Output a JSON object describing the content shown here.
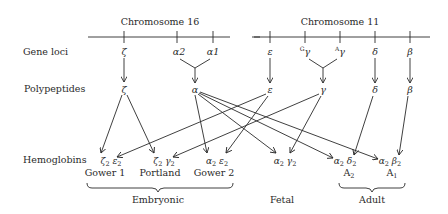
{
  "chromosomes": [
    {
      "label": "Chromosome 16",
      "genes": [
        "ζ",
        "α2",
        "α1"
      ]
    },
    {
      "label": "Chromosome 11",
      "genes": [
        "ε",
        "Gγ",
        "Aγ",
        "δ",
        "β"
      ]
    }
  ],
  "row_labels": {
    "gene_loci": "Gene loci",
    "polypeptides": "Polypeptides",
    "hemoglobins": "Hemoglobins"
  },
  "gene_loci": {
    "zeta": "ζ",
    "alpha2": "α2",
    "alpha1": "α1",
    "epsilon": "ε",
    "g_gamma_sup": "G",
    "g_gamma": "γ",
    "a_gamma_sup": "A",
    "a_gamma": "γ",
    "delta": "δ",
    "beta": "β"
  },
  "polypeptides": {
    "zeta": "ζ",
    "alpha": "α",
    "epsilon": "ε",
    "gamma": "γ",
    "delta": "δ",
    "beta": "β"
  },
  "hemoglobins": [
    {
      "chains": [
        "ζ",
        "2",
        " ε",
        "2"
      ],
      "name": "Gower 1",
      "name_sub": ""
    },
    {
      "chains": [
        "ζ",
        "2",
        " γ",
        "2"
      ],
      "name": "Portland",
      "name_sub": ""
    },
    {
      "chains": [
        "α",
        "2",
        " ε",
        "2"
      ],
      "name": "Gower 2",
      "name_sub": ""
    },
    {
      "chains": [
        "α",
        "2",
        " γ",
        "2"
      ],
      "name": "",
      "name_sub": ""
    },
    {
      "chains": [
        "α",
        "2",
        " δ",
        "2"
      ],
      "name": "A",
      "name_sub": "2"
    },
    {
      "chains": [
        "α",
        "2",
        " β",
        "2"
      ],
      "name": "A",
      "name_sub": "1"
    }
  ],
  "stages": {
    "embryonic": "Embryonic",
    "fetal": "Fetal",
    "adult": "Adult"
  },
  "colors": {
    "ink": "#2a2a2a",
    "background": "#ffffff"
  }
}
